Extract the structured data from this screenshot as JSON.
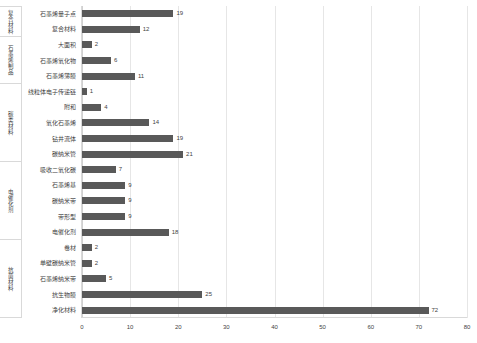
{
  "chart": {
    "title": "",
    "type": "bar-horizontal"
  },
  "chart_data": {
    "type": "bar",
    "orientation": "horizontal",
    "title": "",
    "xlabel": "",
    "ylabel": "",
    "xlim": [
      0,
      80
    ],
    "xticks": [
      0,
      10,
      20,
      30,
      40,
      50,
      60,
      70,
      80
    ],
    "grid": true,
    "legend": false,
    "bar_color": "#595959",
    "groups": [
      {
        "name": "复合材料",
        "categories": [
          "石墨烯量子点",
          "复合材料"
        ],
        "values": [
          19,
          12
        ]
      },
      {
        "name": "石墨烯制品",
        "categories": [
          "大面积",
          "石墨烯氧化物",
          "石墨烯薄膜"
        ],
        "values": [
          2,
          6,
          11
        ]
      },
      {
        "name": "碳类材料",
        "categories": [
          "线粒体电子传递链",
          "附和",
          "氧化石墨烯",
          "钻井流体",
          "碳纳米管"
        ],
        "values": [
          1,
          4,
          14,
          19,
          21
        ]
      },
      {
        "name": "电催化剂",
        "categories": [
          "吸收二氧化碳",
          "石墨烯基",
          "碳纳米带",
          "带形型",
          "电催化剂"
        ],
        "values": [
          7,
          9,
          9,
          9,
          18
        ]
      },
      {
        "name": "抗菌材料",
        "categories": [
          "卷材",
          "单壁碳纳米管",
          "石墨烯纳米带",
          "抗生物膜",
          "净化材料"
        ],
        "values": [
          2,
          2,
          5,
          25,
          72
        ]
      }
    ],
    "categories": [
      "石墨烯量子点",
      "复合材料",
      "大面积",
      "石墨烯氧化物",
      "石墨烯薄膜",
      "线粒体电子传递链",
      "附和",
      "氧化石墨烯",
      "钻井流体",
      "碳纳米管",
      "吸收二氧化碳",
      "石墨烯基",
      "碳纳米带",
      "带形型",
      "电催化剂",
      "卷材",
      "单壁碳纳米管",
      "石墨烯纳米带",
      "抗生物膜",
      "净化材料"
    ],
    "values": [
      19,
      12,
      2,
      6,
      11,
      1,
      4,
      14,
      19,
      21,
      7,
      9,
      9,
      9,
      18,
      2,
      2,
      5,
      25,
      72
    ]
  }
}
